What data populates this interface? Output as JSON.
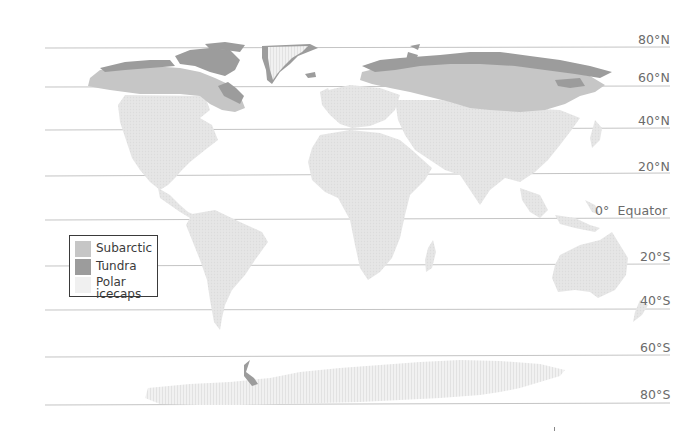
{
  "map": {
    "title": "",
    "colors": {
      "land": "#e8e8e8",
      "subarctic": "#c6c6c6",
      "tundra": "#9c9c9c",
      "polar_icecaps": "#f0f0f0",
      "gridline": "#c4c4c4",
      "label": "#6b6b6b",
      "legend_border": "#3a3a3a"
    },
    "latitudes": [
      {
        "label": "80°N",
        "y": 48
      },
      {
        "label": "60°N",
        "y": 87
      },
      {
        "label": "40°N",
        "y": 130
      },
      {
        "label": "20°N",
        "y": 176
      },
      {
        "label": "0°  Equator",
        "y": 220
      },
      {
        "label": "20°S",
        "y": 266
      },
      {
        "label": "40°S",
        "y": 310
      },
      {
        "label": "60°S",
        "y": 357
      },
      {
        "label": "80°S",
        "y": 405
      }
    ],
    "legend": {
      "items": [
        {
          "label": "Subarctic",
          "color": "#c6c6c6"
        },
        {
          "label": "Tundra",
          "color": "#9c9c9c"
        },
        {
          "label_line1": "Polar",
          "label_line2": "icecaps",
          "color": "#f0f0f0"
        }
      ]
    },
    "regions": [
      "Subarctic",
      "Tundra",
      "Polar icecaps"
    ]
  }
}
